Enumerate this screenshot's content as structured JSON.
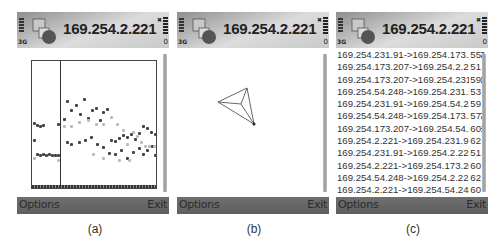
{
  "header": {
    "title": "169.254.2.221",
    "network": "3G",
    "battery_indicator": "0",
    "icons": [
      "signal-strength-icon",
      "app-puzzle-icon",
      "battery-icon"
    ]
  },
  "softkeys": {
    "left": "Options",
    "right": "Exit"
  },
  "captions": [
    "(a)",
    "(b)",
    "(c)"
  ],
  "panel_a": {
    "view": "dot-plot",
    "points_dark": [
      [
        1,
        78
      ],
      [
        4,
        92
      ],
      [
        7,
        93
      ],
      [
        10,
        92
      ],
      [
        13,
        93
      ],
      [
        16,
        92
      ],
      [
        19,
        93
      ],
      [
        22,
        93
      ],
      [
        25,
        93
      ],
      [
        1,
        61
      ],
      [
        4,
        63
      ],
      [
        7,
        64
      ],
      [
        10,
        63
      ],
      [
        25,
        62
      ],
      [
        31,
        57
      ],
      [
        34,
        39
      ],
      [
        38,
        48
      ],
      [
        43,
        43
      ],
      [
        47,
        52
      ],
      [
        51,
        37
      ],
      [
        55,
        56
      ],
      [
        59,
        48
      ],
      [
        63,
        46
      ],
      [
        67,
        58
      ],
      [
        70,
        50
      ],
      [
        74,
        47
      ],
      [
        78,
        78
      ],
      [
        82,
        79
      ],
      [
        86,
        76
      ],
      [
        90,
        73
      ],
      [
        94,
        75
      ],
      [
        98,
        72
      ],
      [
        102,
        77
      ],
      [
        106,
        71
      ],
      [
        110,
        64
      ],
      [
        114,
        66
      ],
      [
        118,
        70
      ],
      [
        122,
        72
      ],
      [
        34,
        80
      ],
      [
        38,
        82
      ],
      [
        46,
        80
      ],
      [
        52,
        78
      ],
      [
        58,
        75
      ],
      [
        64,
        82
      ],
      [
        70,
        85
      ],
      [
        76,
        91
      ],
      [
        82,
        92
      ],
      [
        88,
        88
      ],
      [
        94,
        96
      ],
      [
        100,
        90
      ],
      [
        106,
        86
      ],
      [
        110,
        92
      ],
      [
        114,
        88
      ],
      [
        119,
        84
      ],
      [
        122,
        93
      ]
    ],
    "points_light": [
      [
        1,
        96
      ],
      [
        25,
        98
      ],
      [
        31,
        64
      ],
      [
        38,
        64
      ],
      [
        46,
        60
      ],
      [
        55,
        58
      ],
      [
        63,
        62
      ],
      [
        70,
        62
      ],
      [
        78,
        55
      ],
      [
        84,
        62
      ],
      [
        90,
        68
      ],
      [
        94,
        82
      ],
      [
        100,
        70
      ],
      [
        104,
        74
      ],
      [
        108,
        80
      ],
      [
        112,
        84
      ],
      [
        116,
        84
      ],
      [
        121,
        84
      ],
      [
        60,
        92
      ],
      [
        70,
        96
      ],
      [
        86,
        98
      ],
      [
        96,
        98
      ]
    ]
  },
  "panel_b": {
    "view": "topology-graph",
    "nodes": [
      [
        41,
        90
      ],
      [
        70,
        76
      ],
      [
        77,
        112
      ],
      [
        64,
        92
      ]
    ],
    "edges": [
      [
        0,
        1
      ],
      [
        1,
        2
      ],
      [
        2,
        0
      ],
      [
        0,
        3
      ],
      [
        1,
        3
      ],
      [
        2,
        3
      ]
    ]
  },
  "panel_c": {
    "view": "link-list",
    "rows": [
      {
        "link": "169.254.231.91->169.254.173.207",
        "value": "55"
      },
      {
        "link": "169.254.173.207->169.254.2.221",
        "value": "51"
      },
      {
        "link": "169.254.173.207->169.254.231.91",
        "value": "59"
      },
      {
        "link": "169.254.54.248->169.254.231.91",
        "value": "53"
      },
      {
        "link": "169.254.231.91->169.254.54.248",
        "value": "59"
      },
      {
        "link": "169.254.54.248->169.254.173.207",
        "value": "57"
      },
      {
        "link": "169.254.173.207->169.254.54.248",
        "value": "60"
      },
      {
        "link": "169.254.2.221->169.254.231.91",
        "value": "62"
      },
      {
        "link": "169.254.231.91->169.254.2.221",
        "value": "51"
      },
      {
        "link": "169.254.2.221->169.254.173.207",
        "value": "60"
      },
      {
        "link": "169.254.54.248->169.254.2.221",
        "value": "62"
      },
      {
        "link": "169.254.2.221->169.254.54.248",
        "value": "60"
      }
    ]
  }
}
